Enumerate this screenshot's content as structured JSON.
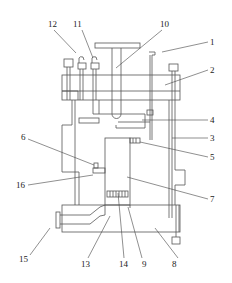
{
  "diagram": {
    "type": "patent-mechanical-drawing",
    "colors": {
      "line": "#555555",
      "label": "#222222",
      "background": "#ffffff"
    },
    "labels": [
      {
        "id": "1",
        "text": "1"
      },
      {
        "id": "2",
        "text": "2"
      },
      {
        "id": "3",
        "text": "3"
      },
      {
        "id": "4",
        "text": "4"
      },
      {
        "id": "5",
        "text": "5"
      },
      {
        "id": "6",
        "text": "6"
      },
      {
        "id": "7",
        "text": "7"
      },
      {
        "id": "8",
        "text": "8"
      },
      {
        "id": "9",
        "text": "9"
      },
      {
        "id": "10",
        "text": "10"
      },
      {
        "id": "11",
        "text": "11"
      },
      {
        "id": "12",
        "text": "12"
      },
      {
        "id": "13",
        "text": "13"
      },
      {
        "id": "14",
        "text": "14"
      },
      {
        "id": "15",
        "text": "15"
      },
      {
        "id": "16",
        "text": "16"
      }
    ]
  }
}
